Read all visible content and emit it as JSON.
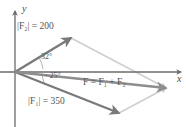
{
  "figure": {
    "type": "vector-force-diagram",
    "background_color": "#ffffff",
    "axes": {
      "x_label": "x",
      "y_label": "y",
      "axis_color": "#6b6b6b",
      "origin": [
        15,
        72
      ],
      "x_axis_end": [
        182,
        72
      ],
      "y_axis_top": [
        15,
        10
      ],
      "y_axis_bottom": [
        15,
        127
      ]
    },
    "colors": {
      "vector_dark": "#7a7a7a",
      "vector_medium": "#8e8e8e",
      "parallelogram_light": "#cfcfcf",
      "text": "#555555",
      "angle_arc": "#9a9a9a"
    },
    "vectors": [
      {
        "name": "F2",
        "label": "|F₂| = 200",
        "magnitude": 200,
        "angle_deg": 32,
        "start": [
          15,
          72
        ],
        "end": [
          71,
          38
        ],
        "color": "#7a7a7a"
      },
      {
        "name": "F1",
        "label": "|F₁| = 350",
        "magnitude": 350,
        "angle_deg": -25,
        "start": [
          15,
          72
        ],
        "end": [
          119,
          113
        ],
        "color": "#7a7a7a"
      },
      {
        "name": "F",
        "label": "F = F₁ + F₂",
        "start": [
          15,
          72
        ],
        "end": [
          166,
          88
        ],
        "color": "#8e8e8e"
      }
    ],
    "parallelogram": {
      "vertices": [
        [
          15,
          72
        ],
        [
          71,
          38
        ],
        [
          166,
          88
        ],
        [
          119,
          113
        ]
      ],
      "color": "#cfcfcf"
    },
    "angles": [
      {
        "name": "angle-f2",
        "value": "32°",
        "position": [
          41,
          55
        ]
      },
      {
        "name": "angle-f1",
        "value": "−25°",
        "position": [
          45,
          74
        ]
      }
    ],
    "labels": {
      "f2_magnitude": {
        "text": "|F₂| = 200",
        "position": [
          17,
          24
        ]
      },
      "f1_magnitude": {
        "text": "|F₁| = 350",
        "position": [
          28,
          99
        ]
      },
      "resultant": {
        "text": "F = F₁ + F₂",
        "position": [
          83,
          79
        ]
      },
      "x_axis": {
        "text": "x",
        "position": [
          177,
          78
        ]
      },
      "y_axis": {
        "text": "y",
        "position": [
          22,
          6
        ]
      }
    }
  }
}
